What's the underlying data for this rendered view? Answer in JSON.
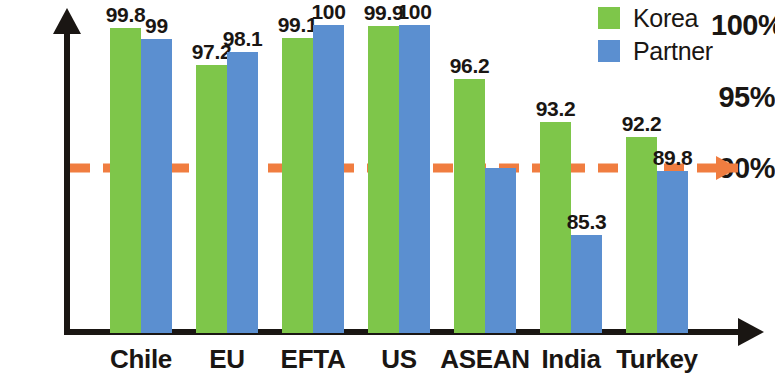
{
  "chart_data": {
    "type": "bar",
    "title": "",
    "subtitle": "",
    "xlabel": "",
    "ylabel": "",
    "categories": [
      "Chile",
      "EU",
      "EFTA",
      "US",
      "ASEAN",
      "India",
      "Turkey"
    ],
    "series": [
      {
        "name": "Korea",
        "color": "#7EC64A",
        "values": [
          99.8,
          97.2,
          99.1,
          99.9,
          96.2,
          93.2,
          92.2
        ],
        "labels": [
          "99.8",
          "97.2",
          "99.1",
          "99.9",
          "96.2",
          "93.2",
          "92.2"
        ]
      },
      {
        "name": "Partner",
        "color": "#5B8FD0",
        "values": [
          99,
          98.1,
          100,
          100,
          90.0,
          85.3,
          89.8
        ],
        "labels": [
          "99",
          "98.1",
          "100",
          "100",
          "",
          "85.3",
          "89.8"
        ]
      }
    ],
    "y_ticks": [
      {
        "label": "100%",
        "value": 100
      },
      {
        "label": "95%",
        "value": 95
      },
      {
        "label": "90%",
        "value": 90
      }
    ],
    "ylim": [
      78.5,
      101.5
    ],
    "grid": false,
    "reference_line": {
      "value": 90,
      "color": "#F07D40",
      "style": "dashed",
      "has_arrow": true
    },
    "legend": {
      "position": "top-right",
      "entries": [
        {
          "label": "Korea",
          "color": "#7EC64A"
        },
        {
          "label": "Partner",
          "color": "#5B8FD0"
        }
      ]
    },
    "axis_color": "#1a1613",
    "background": "#ffffff"
  }
}
